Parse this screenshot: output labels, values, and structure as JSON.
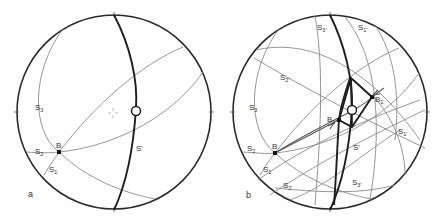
{
  "figure": {
    "panels": [
      {
        "id": "a",
        "label": "a",
        "labels": {
          "S3": {
            "base": "S",
            "sub": "3"
          },
          "S2": {
            "base": "S",
            "sub": "2"
          },
          "S1": {
            "base": "S",
            "sub": "1"
          },
          "B": {
            "base": "B",
            "sub": ""
          },
          "Sprime": {
            "base": "S'",
            "sub": ""
          }
        }
      },
      {
        "id": "b",
        "label": "b",
        "labels": {
          "S3top": {
            "base": "S",
            "sub": "3'"
          },
          "S1top": {
            "base": "S",
            "sub": "1'"
          },
          "S2prime": {
            "base": "S",
            "sub": "2'"
          },
          "S3": {
            "base": "S",
            "sub": "3"
          },
          "S2": {
            "base": "S",
            "sub": "2"
          },
          "S1": {
            "base": "S",
            "sub": "1"
          },
          "S2primeLow": {
            "base": "S",
            "sub": "2'"
          },
          "S3primeLow": {
            "base": "S",
            "sub": "3'"
          },
          "S1primeRight": {
            "base": "S",
            "sub": "1'"
          },
          "B": {
            "base": "B",
            "sub": ""
          },
          "B1": {
            "base": "B",
            "sub": "1'"
          },
          "B1prime": {
            "base": "B",
            "sub": "1'"
          },
          "Sprime": {
            "base": "S'",
            "sub": ""
          }
        }
      }
    ],
    "colors": {
      "primitive": "#2a2a2a",
      "thin_great_circle": "#8a8a8a",
      "thick_great_circle": "#1e1e1e",
      "background": "#ffffff"
    }
  }
}
